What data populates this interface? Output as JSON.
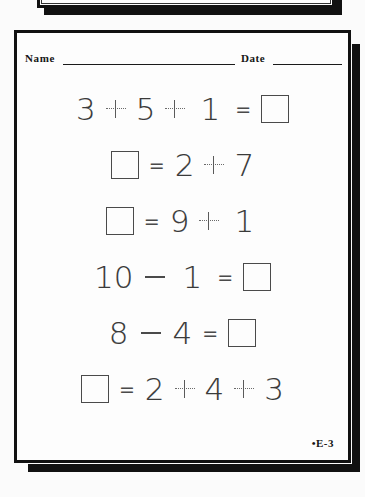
{
  "document": {
    "type": "math-worksheet",
    "footer_code": "•E-3",
    "background_color": "#fbfbfb",
    "ink_color": "#3a3a3a",
    "frame_color": "#111111"
  },
  "header": {
    "name_label": "Name",
    "date_label": "Date"
  },
  "problems": [
    {
      "id": "problem-1",
      "tokens": [
        {
          "kind": "digit",
          "text": "3"
        },
        {
          "kind": "plus"
        },
        {
          "kind": "digit",
          "text": "5"
        },
        {
          "kind": "plus"
        },
        {
          "kind": "digit-one",
          "text": "1"
        },
        {
          "kind": "equals",
          "text": "="
        },
        {
          "kind": "box"
        }
      ]
    },
    {
      "id": "problem-2",
      "tokens": [
        {
          "kind": "box"
        },
        {
          "kind": "equals",
          "text": "="
        },
        {
          "kind": "digit",
          "text": "2"
        },
        {
          "kind": "plus"
        },
        {
          "kind": "digit",
          "text": "7"
        }
      ]
    },
    {
      "id": "problem-3",
      "tokens": [
        {
          "kind": "box"
        },
        {
          "kind": "equals",
          "text": "="
        },
        {
          "kind": "digit",
          "text": "9"
        },
        {
          "kind": "plus"
        },
        {
          "kind": "digit-one",
          "text": "1"
        }
      ]
    },
    {
      "id": "problem-4",
      "tokens": [
        {
          "kind": "digit",
          "text": "10"
        },
        {
          "kind": "minus"
        },
        {
          "kind": "digit-one",
          "text": "1"
        },
        {
          "kind": "equals",
          "text": "="
        },
        {
          "kind": "box"
        }
      ]
    },
    {
      "id": "problem-5",
      "tokens": [
        {
          "kind": "digit",
          "text": "8"
        },
        {
          "kind": "minus"
        },
        {
          "kind": "digit",
          "text": "4"
        },
        {
          "kind": "equals",
          "text": "="
        },
        {
          "kind": "box"
        }
      ]
    },
    {
      "id": "problem-6",
      "tokens": [
        {
          "kind": "box"
        },
        {
          "kind": "equals",
          "text": "="
        },
        {
          "kind": "digit",
          "text": "2"
        },
        {
          "kind": "plus"
        },
        {
          "kind": "digit",
          "text": "4"
        },
        {
          "kind": "plus"
        },
        {
          "kind": "digit",
          "text": "3"
        }
      ]
    }
  ]
}
